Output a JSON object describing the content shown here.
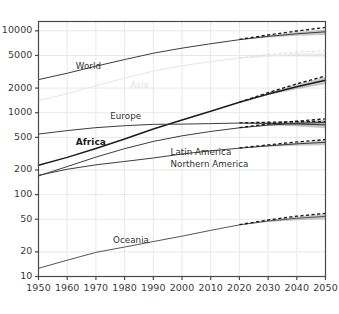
{
  "chart_data": {
    "type": "line",
    "title": "",
    "subtitle": "",
    "xlabel": "",
    "ylabel": "",
    "yscale": "log",
    "xscale": "linear",
    "xlim": [
      1950,
      2050
    ],
    "ylim": [
      10,
      13000
    ],
    "grid": true,
    "legend": "inline-labels",
    "annotations": "Solid lines = estimates/median projection; dashed lines = alternative (high) projection; gray bands = projection uncertainty interval after 2015",
    "x": [
      1950,
      1960,
      1970,
      1980,
      1990,
      2000,
      2010,
      2020,
      2030,
      2040,
      2050
    ],
    "xticklabels": [
      "1950",
      "1960",
      "1970",
      "1980",
      "1990",
      "2000",
      "2010",
      "2020",
      "2030",
      "2040",
      "2050"
    ],
    "yticks": [
      10,
      20,
      50,
      100,
      200,
      500,
      1000,
      2000,
      5000,
      10000
    ],
    "yticklabels": [
      "10",
      "20",
      "50",
      "100",
      "200",
      "500",
      "1000",
      "2000",
      "5000",
      "10000"
    ],
    "series": [
      {
        "name": "World",
        "label": "World",
        "style": "solid",
        "emphasis": "normal",
        "color": "#3d3d3d",
        "values": [
          2536,
          3035,
          3700,
          4458,
          5331,
          6145,
          6958,
          7795,
          8548,
          9199,
          9735
        ],
        "projection_high": [
          null,
          null,
          null,
          null,
          null,
          null,
          null,
          7860,
          8900,
          9950,
          11000
        ],
        "band_low": [
          null,
          null,
          null,
          null,
          null,
          null,
          null,
          7760,
          8300,
          8700,
          8900
        ],
        "band_high": [
          null,
          null,
          null,
          null,
          null,
          null,
          null,
          7830,
          8800,
          9700,
          10400
        ]
      },
      {
        "name": "Asia",
        "label": "Asia",
        "style": "solid",
        "emphasis": "faint",
        "color": "#e6e6e6",
        "values": [
          1405,
          1705,
          2143,
          2642,
          3226,
          3741,
          4210,
          4641,
          4947,
          5093,
          5083
        ],
        "projection_high": [
          null,
          null,
          null,
          null,
          null,
          null,
          null,
          4680,
          5150,
          5500,
          5750
        ],
        "band_low": [
          null,
          null,
          null,
          null,
          null,
          null,
          null,
          4620,
          4800,
          4820,
          4650
        ],
        "band_high": [
          null,
          null,
          null,
          null,
          null,
          null,
          null,
          4665,
          5090,
          5370,
          5520
        ]
      },
      {
        "name": "Africa",
        "label": "Africa",
        "style": "solid",
        "emphasis": "bold",
        "color": "#1c1c1c",
        "values": [
          228,
          285,
          366,
          478,
          632,
          814,
          1044,
          1341,
          1688,
          2077,
          2489
        ],
        "projection_high": [
          null,
          null,
          null,
          null,
          null,
          null,
          null,
          1350,
          1760,
          2250,
          2810
        ],
        "band_low": [
          null,
          null,
          null,
          null,
          null,
          null,
          null,
          1335,
          1630,
          1930,
          2230
        ],
        "band_high": [
          null,
          null,
          null,
          null,
          null,
          null,
          null,
          1348,
          1745,
          2220,
          2750
        ]
      },
      {
        "name": "Europe",
        "label": "Europe",
        "style": "solid",
        "emphasis": "normal",
        "color": "#3d3d3d",
        "values": [
          549,
          605,
          657,
          694,
          721,
          726,
          736,
          748,
          741,
          728,
          710
        ],
        "projection_high": [
          null,
          null,
          null,
          null,
          null,
          null,
          null,
          750,
          765,
          775,
          780
        ],
        "band_low": [
          null,
          null,
          null,
          null,
          null,
          null,
          null,
          745,
          715,
          680,
          645
        ],
        "band_high": [
          null,
          null,
          null,
          null,
          null,
          null,
          null,
          752,
          768,
          780,
          785
        ]
      },
      {
        "name": "Latin America",
        "label": "Latin America",
        "style": "solid",
        "emphasis": "normal",
        "color": "#3d3d3d",
        "values": [
          169,
          220,
          287,
          364,
          446,
          522,
          591,
          654,
          706,
          740,
          762
        ],
        "projection_high": [
          null,
          null,
          null,
          null,
          null,
          null,
          null,
          658,
          728,
          790,
          840
        ],
        "band_low": [
          null,
          null,
          null,
          null,
          null,
          null,
          null,
          650,
          690,
          705,
          700
        ],
        "band_high": [
          null,
          null,
          null,
          null,
          null,
          null,
          null,
          657,
          722,
          775,
          820
        ]
      },
      {
        "name": "Northern America",
        "label": "Northern America",
        "style": "solid",
        "emphasis": "normal",
        "color": "#3d3d3d",
        "values": [
          172,
          204,
          231,
          254,
          280,
          313,
          343,
          369,
          394,
          417,
          435
        ],
        "projection_high": [
          null,
          null,
          null,
          null,
          null,
          null,
          null,
          371,
          405,
          440,
          470
        ],
        "band_low": [
          null,
          null,
          null,
          null,
          null,
          null,
          null,
          367,
          385,
          396,
          402
        ],
        "band_high": [
          null,
          null,
          null,
          null,
          null,
          null,
          null,
          370,
          402,
          433,
          462
        ]
      },
      {
        "name": "Oceania",
        "label": "Oceania",
        "style": "solid",
        "emphasis": "normal",
        "color": "#555555",
        "values": [
          12.6,
          15.8,
          19.7,
          22.9,
          26.7,
          31.1,
          36.6,
          42.7,
          47.6,
          51.4,
          54.3
        ],
        "projection_high": [
          null,
          null,
          null,
          null,
          null,
          null,
          null,
          43.0,
          49.0,
          54.5,
          59.0
        ],
        "band_low": [
          null,
          null,
          null,
          null,
          null,
          null,
          null,
          42.5,
          46.2,
          48.6,
          50.0
        ],
        "band_high": [
          null,
          null,
          null,
          null,
          null,
          null,
          null,
          42.9,
          48.6,
          53.8,
          58.0
        ]
      }
    ],
    "series_label_positions": [
      {
        "name": "World",
        "x": 1963,
        "y": 3650
      },
      {
        "name": "Asia",
        "x": 1982,
        "y": 2140
      },
      {
        "name": "Europe",
        "x": 1975,
        "y": 880
      },
      {
        "name": "Africa",
        "x": 1963,
        "y": 430
      },
      {
        "name": "Latin America",
        "x": 1996,
        "y": 318
      },
      {
        "name": "Northern America",
        "x": 1996,
        "y": 228
      },
      {
        "name": "Oceania",
        "x": 1976,
        "y": 27.5
      }
    ]
  },
  "figure": {
    "background_color": "#ffffff",
    "axis_color": "#4a4a4a",
    "grid_color": "#e8e8e8",
    "band_color": "#9a9a9a",
    "dash_color": "#1a1a1a"
  }
}
